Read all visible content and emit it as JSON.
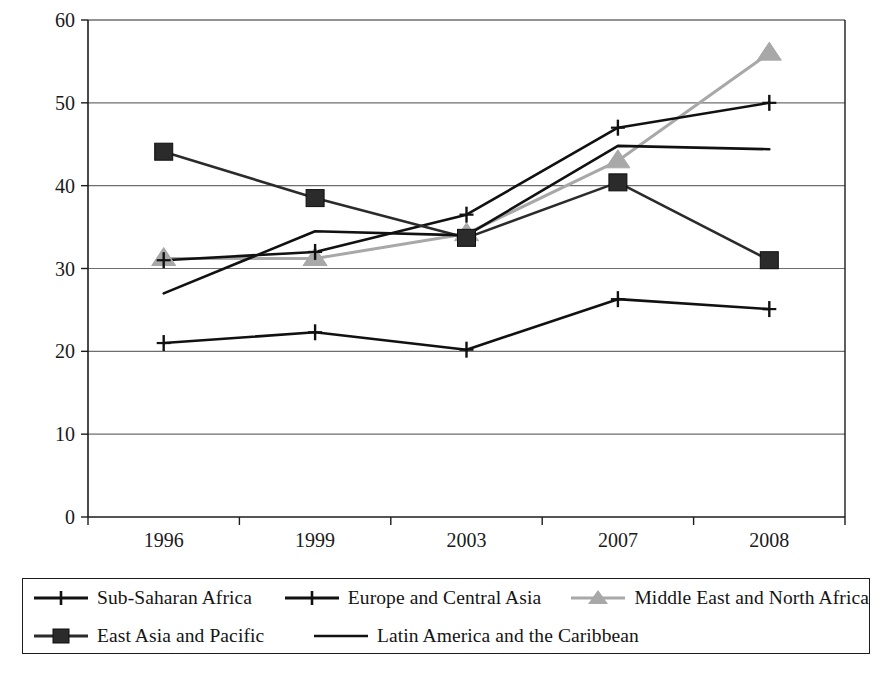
{
  "chart_data": {
    "type": "line",
    "title": "",
    "xlabel": "",
    "ylabel": "",
    "categories": [
      "1996",
      "1999",
      "2003",
      "2007",
      "2008"
    ],
    "ylim": [
      0,
      60
    ],
    "ytick_step": 10,
    "yticks": [
      "0",
      "10",
      "20",
      "30",
      "40",
      "50",
      "60"
    ],
    "grid": "horizontal",
    "legend_position": "bottom",
    "series": [
      {
        "name": "Sub-Saharan Africa",
        "marker": "plus",
        "color": "#111111",
        "values": [
          21.0,
          22.3,
          20.2,
          26.3,
          25.1
        ]
      },
      {
        "name": "Europe and Central Asia",
        "marker": "plus",
        "color": "#111111",
        "values": [
          31.0,
          32.0,
          36.5,
          47.0,
          50.0
        ]
      },
      {
        "name": "Middle East and North Africa",
        "marker": "triangle",
        "color": "#a8a8a8",
        "values": [
          31.2,
          31.2,
          34.2,
          43.0,
          56.0
        ]
      },
      {
        "name": "East Asia and Pacific",
        "marker": "square",
        "color": "#2b2b2b",
        "values": [
          44.1,
          38.5,
          33.7,
          40.4,
          31.0
        ]
      },
      {
        "name": "Latin America and the Caribbean",
        "marker": "none",
        "color": "#111111",
        "values": [
          27.0,
          34.5,
          34.0,
          44.8,
          44.4
        ]
      }
    ]
  },
  "legend": {
    "rows": [
      [
        "Sub-Saharan Africa",
        "Europe and Central Asia",
        "Middle East and North Africa"
      ],
      [
        "East Asia and Pacific",
        "Latin America and the Caribbean"
      ]
    ]
  },
  "axis": {
    "y_ticks": [
      "60",
      "50",
      "40",
      "30",
      "20",
      "10",
      "0"
    ],
    "x_ticks": [
      "1996",
      "1999",
      "2003",
      "2007",
      "2008"
    ]
  },
  "colors": {
    "axis": "#1c1c1c",
    "grid": "#6e6e6e",
    "dark_series": "#111111",
    "gray_series": "#a8a8a8",
    "square_series": "#2b2b2b",
    "background": "#ffffff"
  }
}
